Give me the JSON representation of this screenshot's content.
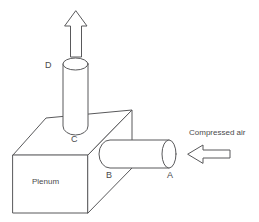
{
  "diagram": {
    "background_color": "#ffffff",
    "line_color": "#59595b",
    "text_color": "#4a4a4c",
    "labels": {
      "point_a": "A",
      "point_b": "B",
      "point_c": "C",
      "point_d": "D",
      "plenum": "Plenum",
      "compressed_air": "Compressed air"
    },
    "arrows": {
      "outlet_direction": "up",
      "inlet_direction": "left"
    },
    "components": {
      "box_name": "plenum-box",
      "vertical_pipe_name": "vertical-outlet-cylinder",
      "horizontal_pipe_name": "horizontal-inlet-pipe"
    }
  }
}
